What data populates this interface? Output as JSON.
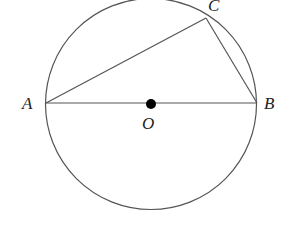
{
  "diagram": {
    "type": "circle-inscribed-triangle",
    "circle": {
      "center": "O",
      "cx": 151,
      "cy": 103,
      "r": 105
    },
    "points": {
      "A": {
        "label": "A",
        "x": 46,
        "y": 103
      },
      "B": {
        "label": "B",
        "x": 257,
        "y": 103
      },
      "C": {
        "label": "C",
        "x": 206,
        "y": 18
      },
      "O": {
        "label": "O",
        "x": 151,
        "y": 103
      }
    },
    "segments": [
      "AB",
      "AC",
      "BC"
    ],
    "stroke_color": "#555555",
    "point_color": "#000000"
  }
}
